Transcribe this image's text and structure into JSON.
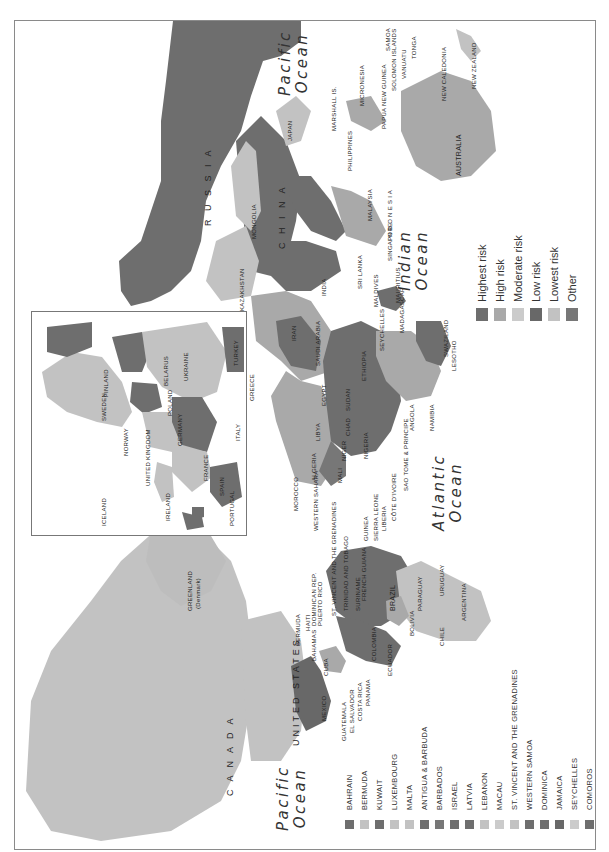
{
  "map": {
    "orientation": "rotated 90 degrees clockwise (north to the left)",
    "oceans": [
      {
        "id": "pacific-top",
        "line1": "Pacific",
        "line2": "Ocean"
      },
      {
        "id": "indian",
        "line1": "Indian",
        "line2": "Ocean"
      },
      {
        "id": "atlantic",
        "line1": "Atlantic",
        "line2": "Ocean"
      },
      {
        "id": "pacific-bottom",
        "line1": "Pacific",
        "line2": "Ocean"
      }
    ],
    "legend": {
      "items": [
        {
          "label": "Highest risk",
          "color": "#6e6e6e"
        },
        {
          "label": "High risk",
          "color": "#a9a9a9"
        },
        {
          "label": "Moderate risk",
          "color": "#cbcbcb"
        },
        {
          "label": "Low risk",
          "color": "#686868"
        },
        {
          "label": "Lowest risk",
          "color": "#c2c2c2"
        },
        {
          "label": "Other",
          "color": "#777777"
        }
      ]
    },
    "small_countries_legend": {
      "items": [
        {
          "label": "BAHRAIN",
          "color": "#6e6e6e"
        },
        {
          "label": "BERMUDA",
          "color": "#c2c2c2"
        },
        {
          "label": "KUWAIT",
          "color": "#6e6e6e"
        },
        {
          "label": "LUXEMBOURG",
          "color": "#c2c2c2"
        },
        {
          "label": "MALTA",
          "color": "#c2c2c2"
        },
        {
          "label": "ANTIGUA & BARBUDA",
          "color": "#6e6e6e"
        },
        {
          "label": "BARBADOS",
          "color": "#777777"
        },
        {
          "label": "ISRAEL",
          "color": "#6e6e6e"
        },
        {
          "label": "LATVIA",
          "color": "#6e6e6e"
        },
        {
          "label": "LEBANON",
          "color": "#c2c2c2"
        },
        {
          "label": "MACAU",
          "color": "#cbcbcb"
        },
        {
          "label": "ST. VINCENT AND THE GRENADINES",
          "color": "#c2c2c2"
        },
        {
          "label": "WESTERN SAMOA",
          "color": "#6e6e6e"
        },
        {
          "label": "DOMINICA",
          "color": "#6e6e6e"
        },
        {
          "label": "JAMAICA",
          "color": "#686868"
        },
        {
          "label": "SEYCHELLES",
          "color": "#cbcbcb"
        },
        {
          "label": "COMOROS",
          "color": "#6e6e6e"
        }
      ]
    },
    "country_labels": {
      "russia": "R U S S I A",
      "china": "C H I N A",
      "mongolia": "MONGOLIA",
      "kazakhstan": "KAZAKHSTAN",
      "india": "INDIA",
      "japan": "JAPAN",
      "s_korea": "S. KOREA",
      "n_korea": "N. KOREA",
      "taiwan": "TAIWAN",
      "hong_kong": "HONG KONG",
      "philippines": "PHILIPPINES",
      "vietnam": "VIETNAM",
      "brunei": "BRUNEI",
      "malaysia": "MALAYSIA",
      "singapore": "SINGAPORE",
      "indonesia": "I N D O N E S I A",
      "sri_lanka": "SRI LANKA",
      "maldives": "MALDIVES",
      "bhutan": "BHUTAN",
      "bangladesh": "BANGLADESH",
      "kyrgyz": "KYRGYZ REPUBLIC",
      "tajikistan": "TAJIKISTAN",
      "pakistan": "PAKISTAN",
      "afghanistan": "AFGHAN.",
      "iran": "IRAN",
      "saudi_arabia": "SAUDI ARABIA",
      "yemen": "YEMEN",
      "oman": "OMAN",
      "iraq": "IRAQ",
      "syria": "SYRIA",
      "jordan": "JORDAN",
      "egypt": "EGYPT",
      "libya": "LIBYA",
      "tunisia": "TUNISIA",
      "algeria": "ALGERIA",
      "morocco": "MOROCCO",
      "western_sahara": "WESTERN SAHARA",
      "mauritania": "MAURITANIA",
      "mali": "MALI",
      "niger": "NIGER",
      "chad": "CHAD",
      "sudan": "SUDAN",
      "ethiopia": "ETHIOPIA",
      "somalia": "SOMALIA",
      "kenya": "KENYA",
      "nigeria": "NIGERIA",
      "cameroon": "CAM.",
      "car": "C.A.R.",
      "dem_rep_congo": "DEM. REP. OF CONGO",
      "congo": "CONGO",
      "gabon": "GABON",
      "angola": "ANGOLA",
      "zambia": "ZAMBIA",
      "tanzania": "TANZANIA",
      "malawi": "MALAWI",
      "mozambique": "MOZAM.",
      "zimbabwe": "ZIMB.",
      "botswana": "BOTS.",
      "namibia": "NAMIBIA",
      "south_africa": "SOUTH AFRICA",
      "swaziland": "SWAZILAND",
      "lesotho": "LESOTHO",
      "madagascar": "MADAGASCAR",
      "mauritius": "MAURITIUS",
      "seychelles": "SEYCHELLES",
      "senegal": "SENEGAL",
      "gambia": "GAMBIA",
      "guinea_bissau": "GUINEA-BISSAU",
      "guinea": "GUINEA",
      "sierra_leone": "SIERRA LEONE",
      "liberia": "LIBERIA",
      "cote_divoire": "CÔTE D'IVOIRE",
      "ghana": "GHANA",
      "togo": "TOGO",
      "eq_guinea": "EQU. GUINEA",
      "sao_tome": "SAO TOME & PRINCIPE",
      "cape_verde": "CAPE VERDE",
      "australia": "AUSTRALIA",
      "new_zealand": "NEW ZEALAND",
      "new_caledonia": "NEW CALEDONIA",
      "papua": "PAPUA NEW GUINEA",
      "solomon": "SOLOMON ISLANDS",
      "vanuatu": "VANUATU",
      "fiji": "FIJI",
      "tonga": "TONGA",
      "samoa": "SAMOA",
      "micronesia": "MICRONESIA",
      "marshall": "MARSHALL IS.",
      "canada": "C A N A D A",
      "united_states": "UNITED STATES",
      "greenland": "GREENLAND",
      "greenland_sub": "(Denmark)",
      "mexico": "MEXICO",
      "guatemala": "GUATEMALA",
      "el_salvador": "EL SALVADOR",
      "costa_rica": "COSTA RICA",
      "panama": "PANAMA",
      "honduras": "HONDURAS",
      "nicaragua": "NICARAGUA",
      "cuba": "CUBA",
      "jamaica": "JAMAICA",
      "bahamas": "BAHAMAS",
      "haiti": "HAITI",
      "dominican_rep": "DOMINICAN REP.",
      "puerto_rico": "PUERTO RICO",
      "bermuda": "BERMUDA",
      "st_lucia": "ST. LUCIA",
      "grenada": "GRENADA",
      "st_vincent": "ST. VINCENT AND THE GRENADINES",
      "trinidad": "TRINIDAD AND TOBAGO",
      "dom": "DOM.",
      "guyana": "GUYANA",
      "suriname": "SURINAME",
      "french_guiana": "FRENCH GUIANA",
      "venezuela": "VENEZ.",
      "colombia": "COLOMBIA",
      "ecuador": "ECUADOR",
      "peru": "PERU",
      "brazil": "BRAZIL",
      "bolivia": "BOLIVIA",
      "paraguay": "PARAGUAY",
      "uruguay": "URUGUAY",
      "chile": "CHILE",
      "argentina": "ARGENTINA"
    },
    "inset_labels": {
      "iceland": "ICELAND",
      "ireland": "IRELAND",
      "united_kingdom": "UNITED KINGDOM",
      "portugal": "PORTUGAL",
      "spain": "SPAIN",
      "france": "FRANCE",
      "norway": "NORWAY",
      "sweden": "SWEDEN",
      "finland": "FINLAND",
      "den": "DEN.",
      "neth": "NETH.",
      "belg": "BELG.",
      "lux": "LUX.",
      "switz": "SWITZ.",
      "germany": "GERMANY",
      "poland": "POLAND",
      "czech": "CZECH",
      "aus": "AUS.",
      "hun": "HUN.",
      "rus": "RUS.",
      "lith": "LITH.",
      "latvia": "LATVIA",
      "estonia": "ESTONIA",
      "belarus": "BELARUS",
      "ukraine": "UKRAINE",
      "mold": "MOLD.",
      "rom": "ROM.",
      "serbia": "SERBIA",
      "bulg": "BULG.",
      "mac": "MAC.",
      "alb": "ALB.",
      "greece": "GREECE",
      "italy": "ITALY",
      "turkey": "TURKEY",
      "cyp": "CYP.",
      "slo": "SLO."
    }
  }
}
